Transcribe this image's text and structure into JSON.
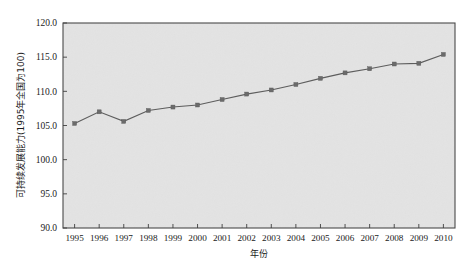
{
  "chart_data": {
    "type": "line",
    "title": "",
    "xlabel": "年份",
    "ylabel": "可持续发展能力(1995年全国为100)",
    "categories": [
      "1995",
      "1996",
      "1997",
      "1998",
      "1999",
      "2000",
      "2001",
      "2002",
      "2003",
      "2004",
      "2005",
      "2006",
      "2007",
      "2008",
      "2009",
      "2010"
    ],
    "values": [
      105.3,
      107.0,
      105.6,
      107.2,
      107.7,
      108.0,
      108.8,
      109.6,
      110.2,
      111.0,
      111.9,
      112.7,
      113.3,
      114.0,
      114.1,
      115.4
    ],
    "series": [
      {
        "name": "可持续发展能力",
        "values": [
          105.3,
          107.0,
          105.6,
          107.2,
          107.7,
          108.0,
          108.8,
          109.6,
          110.2,
          111.0,
          111.9,
          112.7,
          113.3,
          114.0,
          114.1,
          115.4
        ]
      }
    ],
    "ylim": [
      90.0,
      120.0
    ],
    "yticks": [
      90.0,
      95.0,
      100.0,
      105.0,
      110.0,
      115.0,
      120.0
    ],
    "ytick_labels": [
      "90.0",
      "95.0",
      "100.0",
      "105.0",
      "110.0",
      "115.0",
      "120.0"
    ],
    "xtick_labels": [
      "1995",
      "1996",
      "1997",
      "1998",
      "1999",
      "2000",
      "2001",
      "2002",
      "2003",
      "2004",
      "2005",
      "2006",
      "2007",
      "2008",
      "2009",
      "2010"
    ],
    "grid": false,
    "legend": false,
    "legend_position": "none",
    "marker": "square",
    "colors": {
      "plot_background": "#e3e3e3",
      "line": "#5d5d5d",
      "marker": "#6b6b6b",
      "frame": "#4a4a4a",
      "text": "#1a1a1a",
      "page_background": "#ffffff"
    }
  }
}
